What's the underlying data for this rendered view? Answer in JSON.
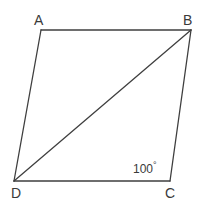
{
  "figure": {
    "kind": "parallelogram-with-diagonal",
    "background_color": "#ffffff",
    "stroke_color": "#3f3f3f",
    "text_color": "#3a3a3a",
    "stroke_width": 1.3,
    "canvas": {
      "width": 204,
      "height": 211
    },
    "vertices": [
      {
        "id": "A",
        "label": "A",
        "x": 41,
        "y": 30
      },
      {
        "id": "B",
        "label": "B",
        "x": 191,
        "y": 30
      },
      {
        "id": "C",
        "label": "C",
        "x": 170,
        "y": 181
      },
      {
        "id": "D",
        "label": "D",
        "x": 14,
        "y": 181
      }
    ],
    "edges": [
      {
        "id": "AB",
        "from": "A",
        "to": "B"
      },
      {
        "id": "BC",
        "from": "B",
        "to": "C"
      },
      {
        "id": "CD",
        "from": "C",
        "to": "D"
      },
      {
        "id": "DA",
        "from": "D",
        "to": "A"
      }
    ],
    "diagonals": [
      {
        "id": "DB",
        "from": "D",
        "to": "B"
      }
    ],
    "angle_annotations": [
      {
        "id": "angle-C",
        "at_vertex": "C",
        "value": "100",
        "degree_symbol": "°",
        "text": "100°"
      }
    ],
    "labels": {
      "A": "A",
      "B": "B",
      "C": "C",
      "D": "D"
    }
  }
}
